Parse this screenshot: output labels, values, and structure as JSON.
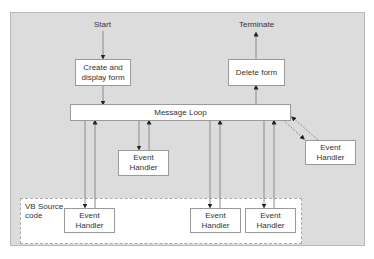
{
  "diagram": {
    "type": "flowchart",
    "start_label": "Start",
    "terminate_label": "Terminate",
    "nodes": {
      "create_form": "Create and display form",
      "delete_form": "Delete form",
      "message_loop": "Message Loop",
      "handler_middle": "Event Handler",
      "handler_right": "Event Handler",
      "handler_vb_1": "Event Handler",
      "handler_vb_2": "Event Handler",
      "handler_vb_3": "Event Handler"
    },
    "region": {
      "vb_source_label": "VB Source code"
    },
    "edges": [
      {
        "from": "Start",
        "to": "Create and display form"
      },
      {
        "from": "Create and display form",
        "to": "Message Loop"
      },
      {
        "from": "Message Loop",
        "to": "Delete form"
      },
      {
        "from": "Delete form",
        "to": "Terminate"
      },
      {
        "from": "Message Loop",
        "to": "Event Handler (middle)",
        "bidirectional": true
      },
      {
        "from": "Message Loop",
        "to": "Event Handler (right, external)",
        "bidirectional": true,
        "style": "dashed"
      },
      {
        "from": "Message Loop",
        "to": "Event Handler (VB 1)",
        "bidirectional": true
      },
      {
        "from": "Message Loop",
        "to": "Event Handler (VB 2)",
        "bidirectional": true
      },
      {
        "from": "Message Loop",
        "to": "Event Handler (VB 3)",
        "bidirectional": true
      }
    ],
    "colors": {
      "panel_bg": "#dcdcdc",
      "box_bg": "#ffffff",
      "line": "#7a7a7a",
      "arrow": "#222222"
    }
  }
}
